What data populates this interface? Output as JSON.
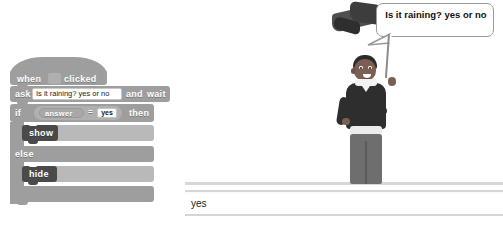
{
  "app": {
    "environment": "Scratch block editor with stage"
  },
  "scripts": {
    "hat_block": {
      "word_when": "when",
      "word_clicked": "clicked",
      "flag_slot_icon": "green-flag-icon"
    },
    "ask_block": {
      "word_ask": "ask",
      "question_value": "Is it raining? yes or no",
      "question_placeholder": "What's your name?",
      "word_and": "and",
      "word_wait": "wait"
    },
    "if_block": {
      "word_if": "if",
      "word_then": "then",
      "word_else": "else",
      "operator": "=",
      "reporter_label": "answer",
      "compare_value": "yes",
      "compare_placeholder": ""
    },
    "looks_blocks": [
      {
        "label": "show"
      },
      {
        "label": "hide"
      }
    ]
  },
  "stage": {
    "speech_bubble_text": "Is it raining? yes or no",
    "sprite_name": "boy-sprite",
    "partial_sprite_name": "partial-dark-sprite"
  },
  "answer_bar": {
    "value": "yes",
    "placeholder": ""
  },
  "colors": {
    "block_gray": "#9e9e9e",
    "looks_block_dark": "#4a4a4a",
    "operator_gray": "#b0b0b0",
    "input_white": "#ffffff",
    "stage_ground": "#d8d8d8",
    "bubble_border": "#9a9a9a"
  }
}
